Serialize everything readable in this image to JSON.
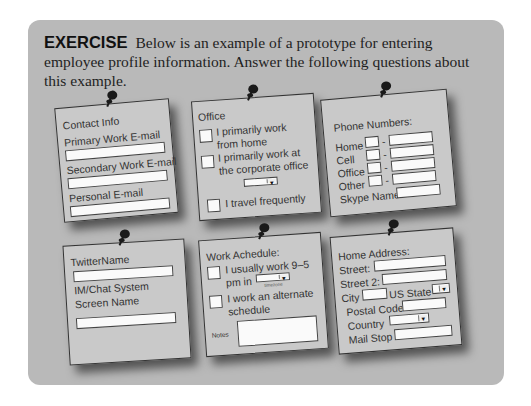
{
  "exercise": {
    "label": "EXERCISE",
    "text": "Below is an example of a prototype for entering employee profile information. Answer the following questions about this example."
  },
  "cards": {
    "contact": {
      "title": "Contact Info",
      "fields": [
        "Primary Work E-mail",
        "Secondary Work E-mail",
        "Personal E-mail"
      ]
    },
    "office": {
      "title": "Office",
      "options": [
        {
          "line1": "I primarily work",
          "line2": "from home"
        },
        {
          "line1": "I primarily work at",
          "line2": "the corporate office"
        },
        {
          "line1": "I travel frequently",
          "line2": ""
        }
      ],
      "dropdown_arrow": "▼"
    },
    "phone": {
      "title": "Phone Numbers:",
      "rows": [
        "Home",
        "Cell",
        "Office",
        "Other"
      ],
      "separator": "-",
      "skype_label": "Skype Name"
    },
    "social": {
      "twitter_label": "TwitterName",
      "im_label_1": "IM/Chat System",
      "im_label_2": "Screen Name"
    },
    "schedule": {
      "title": "Work Achedule:",
      "option1_line1": "I usually work 9–5",
      "option1_line2": "pm in",
      "timezone_hint": "timezone",
      "option2_line1": "I work an alternate",
      "option2_line2": "schedule",
      "notes_label": "Notes",
      "dropdown_arrow": "▼"
    },
    "address": {
      "title": "Home Address:",
      "street": "Street:",
      "street2": "Street 2:",
      "city": "City",
      "state": "US State",
      "postal": "Postal Code",
      "country": "Country",
      "mailstop": "Mail Stop",
      "dropdown_arrow": "▼"
    }
  },
  "colors": {
    "panel": "#b9b9b9",
    "card": "#c9c9c9",
    "field": "#fafafa",
    "pin": "#1a1a1a"
  }
}
